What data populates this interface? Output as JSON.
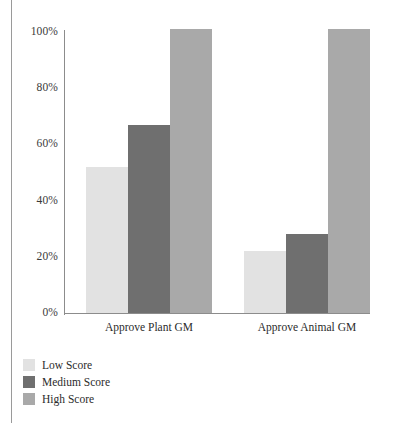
{
  "figure": {
    "clipped_top_text": "",
    "axis_color": "#8c8c8c"
  },
  "chart_data": {
    "type": "bar",
    "title": "",
    "xlabel": "",
    "ylabel": "",
    "categories": [
      "Approve Plant GM",
      "Approve Animal GM"
    ],
    "series": [
      {
        "name": "Low Score",
        "color": "#e2e2e2",
        "values": [
          52,
          22
        ]
      },
      {
        "name": "Medium Score",
        "color": "#6f6f6f",
        "values": [
          67,
          28
        ]
      },
      {
        "name": "High Score",
        "color": "#a9a9a9",
        "values": [
          101,
          101
        ]
      }
    ],
    "ylim": [
      0,
      100
    ],
    "ytick_labels": [
      "0%",
      "20%",
      "40%",
      "60%",
      "80%",
      "100%"
    ],
    "ytick_values": [
      0,
      20,
      40,
      60,
      80,
      100
    ],
    "grid": false,
    "legend_position": "below-left",
    "value_format": "percent"
  },
  "legend": {
    "items": [
      {
        "label": "Low Score",
        "color": "#e2e2e2"
      },
      {
        "label": "Medium Score",
        "color": "#6f6f6f"
      },
      {
        "label": "High Score",
        "color": "#a9a9a9"
      }
    ]
  }
}
